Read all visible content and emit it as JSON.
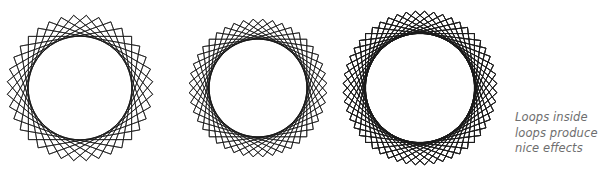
{
  "figure": {
    "title": "Loops inside loops produce nice effects",
    "background_color": "#ffffff",
    "stroke_color": "#1a1a1a",
    "width": 599,
    "height": 179
  },
  "caption": {
    "color": "#6e6e6e",
    "style": "italic",
    "line1": "Loops inside",
    "line2": "loops produce",
    "line3": "nice effects"
  },
  "chart_data": {
    "type": "line",
    "title": "Loops inside loops produce nice effects",
    "grid": false,
    "legend": false,
    "xlabel": "",
    "ylabel": "",
    "panels": [
      {
        "name": "panel-1",
        "label": "18 squares",
        "squares": 18,
        "rotation_step_deg": 20,
        "total_rotation_deg": 360,
        "center_x": 80,
        "center_y": 88,
        "half_diagonal": 73,
        "stroke_width": 0.75,
        "stroke_color": "#1a1a1a"
      },
      {
        "name": "panel-2",
        "label": "22 squares",
        "squares": 22,
        "rotation_step_deg": 16.3636,
        "total_rotation_deg": 360,
        "center_x": 258,
        "center_y": 88,
        "half_diagonal": 69,
        "stroke_width": 0.75,
        "stroke_color": "#1a1a1a"
      },
      {
        "name": "panel-3",
        "label": "52 squares",
        "squares": 52,
        "rotation_step_deg": 6.9231,
        "total_rotation_deg": 360,
        "center_x": 420,
        "center_y": 88,
        "half_diagonal": 77,
        "stroke_width": 0.7,
        "stroke_color": "#1a1a1a"
      }
    ]
  }
}
